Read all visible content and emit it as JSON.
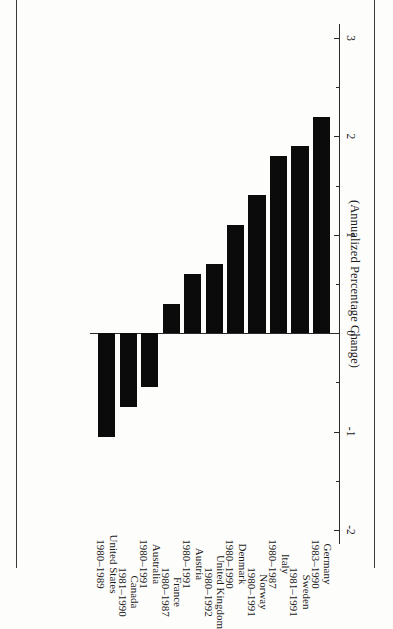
{
  "figure": {
    "axis_title": "(Annualized Percentage Change)",
    "orientation": "rotated-90"
  },
  "chart_data": {
    "type": "bar",
    "title": "(Annualized Percentage Change)",
    "xlabel": "",
    "ylabel": "(Annualized Percentage Change)",
    "ylim": [
      -2,
      3
    ],
    "grid": false,
    "legend": null,
    "tick_labels": [
      "3",
      "2",
      "1",
      "0",
      "-1",
      "-2"
    ],
    "tick_values": [
      3,
      2,
      1,
      0,
      -1,
      -2
    ],
    "minor_tick_step": 0.5,
    "bar_color": "#0b0b0b",
    "categories": [
      "Germany",
      "Sweden",
      "Italy",
      "Norway",
      "Denmark",
      "United Kingdom",
      "Austria",
      "France",
      "Australia",
      "Canada",
      "United States"
    ],
    "periods": [
      "1983–1990",
      "1981–1991",
      "1980–1987",
      "1980–1991",
      "1980–1990",
      "1980–1992",
      "1980–1991",
      "1980–1987",
      "1980–1991",
      "1981–1990",
      "1980–1989"
    ],
    "values": [
      2.2,
      1.9,
      1.8,
      1.4,
      1.1,
      0.7,
      0.6,
      0.3,
      -0.55,
      -0.75,
      -1.05
    ]
  },
  "items": [
    {
      "label": "Germany",
      "years": "1983–1990",
      "value": 2.2
    },
    {
      "label": "Sweden",
      "years": "1981–1991",
      "value": 1.9
    },
    {
      "label": "Italy",
      "years": "1980–1987",
      "value": 1.8
    },
    {
      "label": "Norway",
      "years": "1980–1991",
      "value": 1.4
    },
    {
      "label": "Denmark",
      "years": "1980–1990",
      "value": 1.1
    },
    {
      "label": "United Kingdom",
      "years": "1980–1992",
      "value": 0.7
    },
    {
      "label": "Austria",
      "years": "1980–1991",
      "value": 0.6
    },
    {
      "label": "France",
      "years": "1980–1987",
      "value": 0.3
    },
    {
      "label": "Australia",
      "years": "1980–1991",
      "value": -0.55
    },
    {
      "label": "Canada",
      "years": "1981–1990",
      "value": -0.75
    },
    {
      "label": "United States",
      "years": "1980–1989",
      "value": -1.05
    }
  ]
}
